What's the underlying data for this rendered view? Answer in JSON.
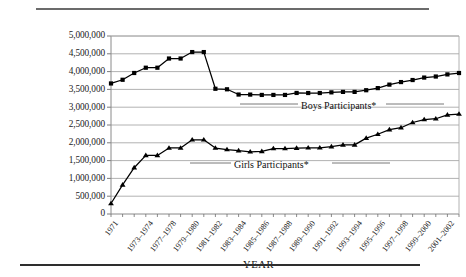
{
  "chart_data": {
    "type": "line",
    "title": "",
    "xlabel": "YEAR",
    "ylabel": "",
    "ylim": [
      0,
      5000000
    ],
    "ytick_step": 500000,
    "grid": true,
    "legend_position": "inline-annotations",
    "yticks": [
      "5,000,000",
      "4,500,000",
      "4,000,000",
      "3,500,000",
      "3,000,000",
      "2,500,000",
      "2,000,000",
      "1,500,000",
      "1,000,000",
      "500,000",
      "0"
    ],
    "categories": [
      "1971",
      "1972-1973",
      "1973-1974",
      "1974-1975",
      "1975-1976",
      "1976-1977",
      "1977-1978",
      "1978-1979",
      "1979-1980",
      "1980-1981",
      "1981-1982",
      "1982-1983",
      "1983-1984",
      "1984-1985",
      "1985-1986",
      "1986-1987",
      "1987-1988",
      "1988-1989",
      "1989-1990",
      "1990-1991",
      "1991-1992",
      "1992-1993",
      "1993-1994",
      "1994-1995",
      "1995-1996",
      "1996-1997",
      "1997-1998",
      "1998-1999",
      "1999-2000",
      "2000-2001",
      "2001-2002"
    ],
    "xtick_labels": [
      "1971",
      "1973-1974",
      "1977-1978",
      "1979-1980",
      "1981-1982",
      "1983-1984",
      "1985-1986",
      "1987-1988",
      "1989-1990",
      "1991-1992",
      "1993-1994",
      "1995-1996",
      "1997-1998",
      "1999-2000",
      "2001-2002"
    ],
    "series": [
      {
        "name": "Boys Participants*",
        "marker": "square",
        "label": "Boys Participants*",
        "values": [
          3666917,
          3770621,
          3960932,
          4109021,
          4109021,
          4367442,
          4367442,
          4548503,
          4548503,
          3517829,
          3503124,
          3355558,
          3354284,
          3344275,
          3344275,
          3344275,
          3400000,
          3398192,
          3398192,
          3416844,
          3429853,
          3429853,
          3476938,
          3536359,
          3634052,
          3706225,
          3763120,
          3832352,
          3861749,
          3921069,
          3960517
        ]
      },
      {
        "name": "Girls Participants*",
        "marker": "triangle",
        "label": "Girls Participants*",
        "values": [
          294015,
          817073,
          1300169,
          1645039,
          1645039,
          1854400,
          1854400,
          2083040,
          2083040,
          1853789,
          1810671,
          1779972,
          1747346,
          1757884,
          1836356,
          1836356,
          1849684,
          1858659,
          1858659,
          1892316,
          1940801,
          1940801,
          2130315,
          2240461,
          2367936,
          2424021,
          2570333,
          2652726,
          2675874,
          2784154,
          2806998
        ]
      }
    ]
  }
}
